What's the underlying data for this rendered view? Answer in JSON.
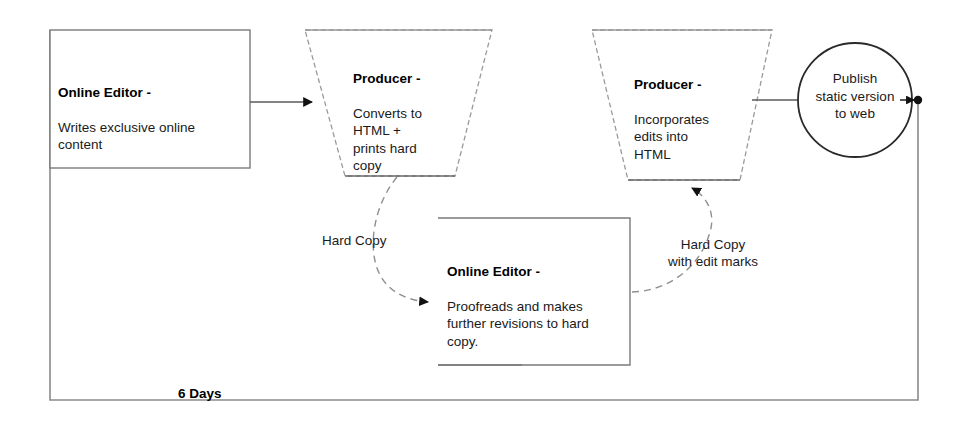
{
  "diagram": {
    "frame": {
      "duration_label": "6 Days"
    },
    "nodes": [
      {
        "id": "online-editor-writes",
        "shape": "rectangle",
        "title": "Online Editor -",
        "body": "Writes exclusive online\ncontent"
      },
      {
        "id": "producer-converts",
        "shape": "trapezoid",
        "title": "Producer -",
        "body": "Converts to\nHTML +\nprints hard\ncopy"
      },
      {
        "id": "online-editor-proofreads",
        "shape": "rectangle",
        "title": "Online Editor -",
        "body": "Proofreads and makes\nfurther revisions to hard\ncopy."
      },
      {
        "id": "producer-incorporates",
        "shape": "trapezoid",
        "title": "Producer -",
        "body": "Incorporates\nedits into\nHTML"
      },
      {
        "id": "publish-static",
        "shape": "circle",
        "title": "",
        "body": "Publish\nstatic version\nto web"
      }
    ],
    "edges": [
      {
        "id": "edge-write-to-convert",
        "label": "",
        "style": "solid-arrow"
      },
      {
        "id": "edge-hard-copy",
        "label": "Hard Copy",
        "style": "dashed-arrow"
      },
      {
        "id": "edge-hard-copy-edits",
        "label": "Hard Copy\nwith edit marks",
        "style": "dashed-arrow"
      },
      {
        "id": "edge-convert-to-circle",
        "label": "",
        "style": "solid-line"
      },
      {
        "id": "edge-circle-to-frame",
        "label": "",
        "style": "solid-arrow-dot"
      }
    ],
    "colors": {
      "stroke": "#5a5a5a",
      "stroke_dark": "#000000",
      "text": "#1a1a1a",
      "background": "#ffffff"
    }
  }
}
